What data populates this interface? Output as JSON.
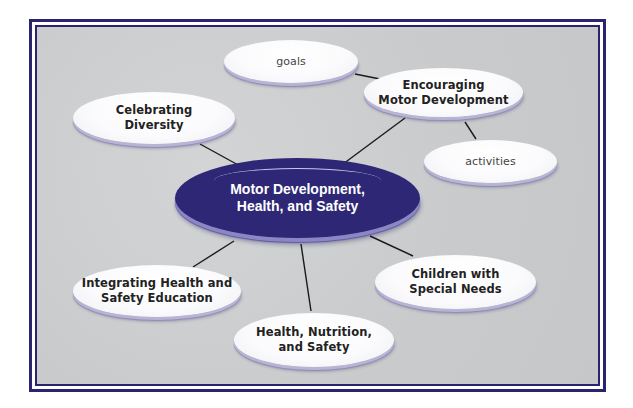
{
  "diagram": {
    "type": "concept-map",
    "colors": {
      "frame": "#2a2470",
      "background": "#cbcdce",
      "center_fill": "#2d2775",
      "node_fill": "#ffffff",
      "link": "#1a1a1a"
    },
    "center": {
      "label": "Motor Development,\nHealth, and Safety"
    },
    "nodes": [
      {
        "id": "goals",
        "label": "goals"
      },
      {
        "id": "encouraging",
        "label": "Encouraging\nMotor Development"
      },
      {
        "id": "activities",
        "label": "activities"
      },
      {
        "id": "celebrating",
        "label": "Celebrating\nDiversity"
      },
      {
        "id": "integrating",
        "label": "Integrating Health and\nSafety Education"
      },
      {
        "id": "health",
        "label": "Health, Nutrition,\nand Safety"
      },
      {
        "id": "children",
        "label": "Children with\nSpecial Needs"
      }
    ],
    "edges": [
      [
        "center",
        "celebrating"
      ],
      [
        "center",
        "encouraging"
      ],
      [
        "encouraging",
        "goals"
      ],
      [
        "encouraging",
        "activities"
      ],
      [
        "center",
        "integrating"
      ],
      [
        "center",
        "health"
      ],
      [
        "center",
        "children"
      ]
    ]
  }
}
